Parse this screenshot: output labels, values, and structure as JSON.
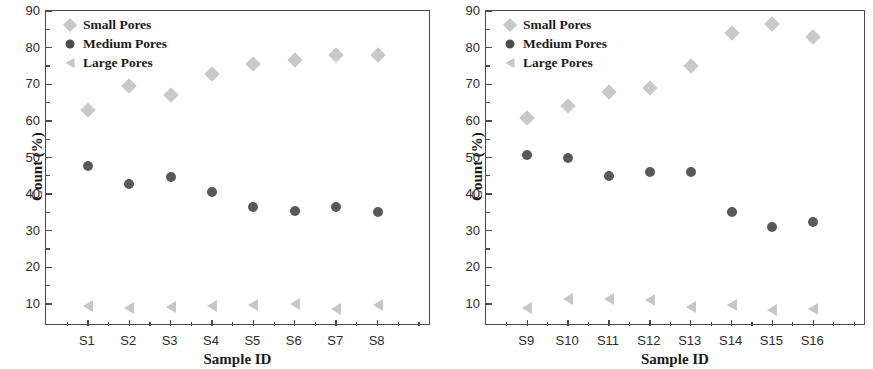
{
  "figure": {
    "panels": [
      {
        "id": "left",
        "xlabel": "Sample ID",
        "ylabel": "Count (%)",
        "legend": [
          {
            "label": "Small Pores",
            "marker": "diamond-icon",
            "color": "#c9c9c9"
          },
          {
            "label": "Medium Pores",
            "marker": "circle-icon",
            "color": "#4d4d4d"
          },
          {
            "label": "Large Pores",
            "marker": "triangle-left-icon",
            "color": "#c6c6c6"
          }
        ]
      },
      {
        "id": "right",
        "xlabel": "Sample ID",
        "ylabel": "Count (%)",
        "legend": [
          {
            "label": "Small Pores",
            "marker": "diamond-icon",
            "color": "#c9c9c9"
          },
          {
            "label": "Medium Pores",
            "marker": "circle-icon",
            "color": "#4d4d4d"
          },
          {
            "label": "Large Pores",
            "marker": "triangle-left-icon",
            "color": "#c6c6c6"
          }
        ]
      }
    ]
  },
  "chart_data": [
    {
      "type": "scatter",
      "title": "",
      "xlabel": "Sample ID",
      "ylabel": "Count (%)",
      "categories": [
        "S1",
        "S2",
        "S3",
        "S4",
        "S5",
        "S6",
        "S7",
        "S8"
      ],
      "ylim": [
        4,
        90
      ],
      "yticks": [
        10,
        20,
        30,
        40,
        50,
        60,
        70,
        80,
        90
      ],
      "yticks_minor": [
        15,
        25,
        35,
        45,
        55,
        65,
        75,
        85
      ],
      "grid": false,
      "legend_position": "top-left",
      "series": [
        {
          "name": "Small Pores",
          "marker": "diamond",
          "color": "#c9c9c9",
          "values": [
            63.0,
            69.5,
            67.0,
            72.7,
            75.5,
            76.5,
            78.0,
            78.0
          ]
        },
        {
          "name": "Medium Pores",
          "marker": "circle",
          "color": "#595959",
          "values": [
            47.8,
            42.7,
            44.6,
            40.6,
            36.5,
            35.3,
            36.4,
            35.1
          ]
        },
        {
          "name": "Large Pores",
          "marker": "triangle-left",
          "color": "#c6c6c6",
          "values": [
            9.5,
            8.8,
            9.2,
            9.4,
            9.8,
            9.9,
            8.6,
            9.7
          ]
        }
      ]
    },
    {
      "type": "scatter",
      "title": "",
      "xlabel": "Sample ID",
      "ylabel": "Count (%)",
      "categories": [
        "S9",
        "S10",
        "S11",
        "S12",
        "S13",
        "S14",
        "S15",
        "S16"
      ],
      "ylim": [
        4,
        90
      ],
      "yticks": [
        10,
        20,
        30,
        40,
        50,
        60,
        70,
        80,
        90
      ],
      "yticks_minor": [
        15,
        25,
        35,
        45,
        55,
        65,
        75,
        85
      ],
      "grid": false,
      "legend_position": "top-left",
      "series": [
        {
          "name": "Small Pores",
          "marker": "diamond",
          "color": "#c9c9c9",
          "values": [
            60.8,
            64.0,
            68.0,
            69.0,
            75.0,
            84.0,
            86.5,
            83.0
          ]
        },
        {
          "name": "Medium Pores",
          "marker": "circle",
          "color": "#595959",
          "values": [
            50.7,
            50.0,
            45.0,
            46.0,
            46.0,
            35.0,
            31.0,
            32.5
          ]
        },
        {
          "name": "Large Pores",
          "marker": "triangle-left",
          "color": "#c6c6c6",
          "values": [
            8.9,
            11.3,
            11.3,
            11.2,
            9.3,
            9.7,
            8.5,
            8.6
          ]
        }
      ]
    }
  ]
}
